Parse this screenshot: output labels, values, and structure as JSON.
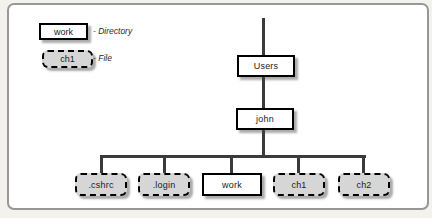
{
  "legend": {
    "directory": {
      "sample_label": "work",
      "description": "- Directory"
    },
    "file": {
      "sample_label": "ch1",
      "description": "- File"
    }
  },
  "tree": {
    "nodes": {
      "users": {
        "label": "Users",
        "type": "directory"
      },
      "john": {
        "label": "john",
        "type": "directory"
      }
    },
    "children": [
      {
        "label": ".cshrc",
        "type": "file"
      },
      {
        "label": ".login",
        "type": "file"
      },
      {
        "label": "work",
        "type": "directory"
      },
      {
        "label": "ch1",
        "type": "file"
      },
      {
        "label": "ch2",
        "type": "file"
      }
    ]
  },
  "colors": {
    "line": "#3b3b3b",
    "box_border": "#000000",
    "file_fill": "#d6d6d6",
    "directory_fill": "#ffffff",
    "frame_border": "#979797",
    "canvas_bg": "#ffffff",
    "page_bg": "#f4f2ed"
  }
}
